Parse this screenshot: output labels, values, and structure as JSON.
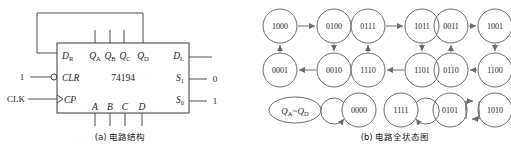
{
  "figure": {
    "panel_a": {
      "caption": "(a) 电路结构",
      "chip_label": "74194",
      "pins_left": [
        {
          "name": "D",
          "sub": "R"
        },
        {
          "name": "CLR",
          "sub": ""
        },
        {
          "name": "CP",
          "sub": ""
        }
      ],
      "pins_right": [
        {
          "name": "D",
          "sub": "L"
        },
        {
          "name": "S",
          "sub": "1"
        },
        {
          "name": "S",
          "sub": "0"
        }
      ],
      "pins_top": [
        {
          "name": "Q",
          "sub": "A"
        },
        {
          "name": "Q",
          "sub": "B"
        },
        {
          "name": "Q",
          "sub": "C"
        },
        {
          "name": "Q",
          "sub": "D"
        }
      ],
      "pins_bottom": [
        {
          "name": "A"
        },
        {
          "name": "B"
        },
        {
          "name": "C"
        },
        {
          "name": "D"
        }
      ],
      "signals": {
        "clr_input": "1",
        "clk_input": "CLK",
        "s1_value": "0",
        "s0_value": "1"
      }
    },
    "panel_b": {
      "caption": "(b) 电路全状态图",
      "legend_label_main": "Q",
      "legend_label_sub1": "A",
      "legend_label_tilde": "~Q",
      "legend_label_sub2": "D",
      "legend_text": "QA~QD",
      "cycles": [
        {
          "states": [
            "1000",
            "0100",
            "0010",
            "0001"
          ]
        },
        {
          "states": [
            "0111",
            "1011",
            "1101",
            "1110"
          ]
        },
        {
          "states": [
            "0011",
            "1001",
            "1100",
            "0110"
          ]
        }
      ],
      "self_loops": [
        {
          "state": "0000",
          "loop_side": "left"
        },
        {
          "state": "1111",
          "loop_side": "right"
        }
      ],
      "two_cycle": {
        "states": [
          "0101",
          "1010"
        ]
      }
    }
  },
  "colors": {
    "line": "#4a4a4a",
    "node": "#6a6a6a",
    "text": "#1a1a1a",
    "background": "#ffffff"
  }
}
